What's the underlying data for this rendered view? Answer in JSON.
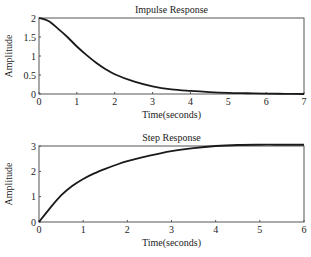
{
  "chart_data": [
    {
      "type": "line",
      "title": "Impulse Response",
      "xlabel": "Time(seconds)",
      "ylabel": "Amplitude",
      "xlim": [
        0,
        7
      ],
      "ylim": [
        0,
        2
      ],
      "xticks": [
        "0",
        "1",
        "2",
        "3",
        "4",
        "5",
        "6",
        "7"
      ],
      "yticks": [
        "0",
        "0.5",
        "1",
        "1.5",
        "2"
      ],
      "grid": false,
      "series": [
        {
          "name": "impulse",
          "x": [
            0,
            0.25,
            0.5,
            0.75,
            1,
            1.25,
            1.5,
            1.75,
            2,
            2.5,
            3,
            3.5,
            4,
            4.5,
            5,
            5.5,
            6,
            6.5,
            7
          ],
          "y": [
            2.0,
            1.92,
            1.72,
            1.5,
            1.25,
            1.03,
            0.83,
            0.66,
            0.52,
            0.33,
            0.2,
            0.12,
            0.08,
            0.05,
            0.03,
            0.02,
            0.01,
            0.005,
            0.0
          ]
        }
      ]
    },
    {
      "type": "line",
      "title": "Step Response",
      "xlabel": "Time(seconds)",
      "ylabel": "Amplitude",
      "xlim": [
        0,
        6
      ],
      "ylim": [
        0,
        3
      ],
      "xticks": [
        "0",
        "1",
        "2",
        "3",
        "4",
        "5",
        "6"
      ],
      "yticks": [
        "0",
        "1",
        "2",
        "3"
      ],
      "grid": false,
      "series": [
        {
          "name": "step",
          "x": [
            0,
            0.25,
            0.5,
            0.75,
            1,
            1.25,
            1.5,
            1.75,
            2,
            2.5,
            3,
            3.5,
            4,
            4.5,
            5,
            5.5,
            6
          ],
          "y": [
            0,
            0.55,
            1.05,
            1.42,
            1.7,
            1.92,
            2.1,
            2.26,
            2.4,
            2.62,
            2.8,
            2.92,
            3.0,
            3.04,
            3.05,
            3.05,
            3.05
          ]
        }
      ]
    }
  ]
}
